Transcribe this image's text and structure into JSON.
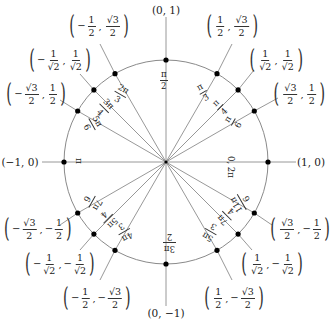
{
  "diagram": {
    "center": [
      166,
      162
    ],
    "radius": 102,
    "colors": {
      "line": "#8c8c8c",
      "circle": "#8a8a8a",
      "point": "#000000",
      "text": "#1a1a1a"
    }
  },
  "axis_labels": {
    "top": "(0, 1)",
    "bottom": "(0, −1)",
    "left": "(−1, 0)",
    "right": "(1, 0)"
  },
  "angles": {
    "a0": {
      "text": "0, 2π"
    },
    "a30": {
      "num": "π",
      "den": "6"
    },
    "a45": {
      "num": "π",
      "den": "4"
    },
    "a60": {
      "num": "π",
      "den": "3"
    },
    "a90": {
      "num": "π",
      "den": "2"
    },
    "a120": {
      "num": "2π",
      "den": "3"
    },
    "a135": {
      "num": "3π",
      "den": "4"
    },
    "a150": {
      "num": "5π",
      "den": "6"
    },
    "a180": {
      "text": "π"
    },
    "a210": {
      "num": "7π",
      "den": "6"
    },
    "a225": {
      "num": "5π",
      "den": "4"
    },
    "a240": {
      "num": "4π",
      "den": "3"
    },
    "a270": {
      "num": "3π",
      "den": "2"
    },
    "a300": {
      "num": "5π",
      "den": "3"
    },
    "a315": {
      "num": "7π",
      "den": "4"
    },
    "a330": {
      "num": "11π",
      "den": "6"
    }
  },
  "coords": {
    "c30": {
      "x_sign": "",
      "x_num": "√3",
      "x_den": "2",
      "y_sign": "",
      "y_num": "1",
      "y_den": "2"
    },
    "c45": {
      "x_sign": "",
      "x_num": "1",
      "x_den": "√2",
      "y_sign": "",
      "y_num": "1",
      "y_den": "√2"
    },
    "c60": {
      "x_sign": "",
      "x_num": "1",
      "x_den": "2",
      "y_sign": "",
      "y_num": "√3",
      "y_den": "2"
    },
    "c120": {
      "x_sign": "−",
      "x_num": "1",
      "x_den": "2",
      "y_sign": "",
      "y_num": "√3",
      "y_den": "2"
    },
    "c135": {
      "x_sign": "−",
      "x_num": "1",
      "x_den": "√2",
      "y_sign": "",
      "y_num": "1",
      "y_den": "√2"
    },
    "c150": {
      "x_sign": "−",
      "x_num": "√3",
      "x_den": "2",
      "y_sign": "",
      "y_num": "1",
      "y_den": "2"
    },
    "c210": {
      "x_sign": "−",
      "x_num": "√3",
      "x_den": "2",
      "y_sign": "−",
      "y_num": "1",
      "y_den": "2"
    },
    "c225": {
      "x_sign": "−",
      "x_num": "1",
      "x_den": "√2",
      "y_sign": "−",
      "y_num": "1",
      "y_den": "√2"
    },
    "c240": {
      "x_sign": "−",
      "x_num": "1",
      "x_den": "2",
      "y_sign": "−",
      "y_num": "√3",
      "y_den": "2"
    },
    "c300": {
      "x_sign": "",
      "x_num": "1",
      "x_den": "2",
      "y_sign": "−",
      "y_num": "√3",
      "y_den": "2"
    },
    "c315": {
      "x_sign": "",
      "x_num": "1",
      "x_den": "√2",
      "y_sign": "−",
      "y_num": "1",
      "y_den": "√2"
    },
    "c330": {
      "x_sign": "",
      "x_num": "√3",
      "x_den": "2",
      "y_sign": "−",
      "y_num": "1",
      "y_den": "2"
    }
  }
}
